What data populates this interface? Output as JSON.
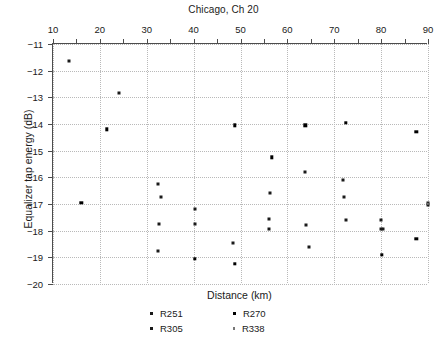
{
  "chart_data": {
    "type": "scatter",
    "title": "Chicago, Ch 20",
    "xlabel": "Distance (km)",
    "ylabel": "Equalizer tap energy (dB)",
    "xlim": [
      10,
      90
    ],
    "ylim": [
      -20,
      -11
    ],
    "y_inverted_axis": false,
    "x_axis_position": "top",
    "grid": true,
    "grid_style": "dotted",
    "xticks_major": [
      10,
      20,
      30,
      40,
      50,
      60,
      70,
      80,
      90
    ],
    "xticks_minor": [
      15,
      25,
      35,
      45,
      55,
      65,
      75,
      85
    ],
    "xticklabels": [
      "10",
      "20",
      "30",
      "40",
      "50",
      "60",
      "70",
      "80",
      "90"
    ],
    "yticks": [
      -11,
      -12,
      -13,
      -14,
      -15,
      -16,
      -17,
      -18,
      -19,
      -20
    ],
    "yticklabels": [
      "−11",
      "−12",
      "−13",
      "−14",
      "−15",
      "−16",
      "−17",
      "−18",
      "−19",
      "−20"
    ],
    "legend_position": "below-axes",
    "series": [
      {
        "name": "R251",
        "color": "#1a1a1a",
        "points": [
          {
            "x": 13.5,
            "y": -11.65
          },
          {
            "x": 24.0,
            "y": -12.85
          },
          {
            "x": 32.3,
            "y": -16.25
          },
          {
            "x": 33.0,
            "y": -16.75
          },
          {
            "x": 40.3,
            "y": -17.2
          },
          {
            "x": 32.4,
            "y": -18.75
          },
          {
            "x": 48.5,
            "y": -18.45
          },
          {
            "x": 56.2,
            "y": -16.6
          },
          {
            "x": 56.0,
            "y": -17.55
          },
          {
            "x": 56.0,
            "y": -17.95
          },
          {
            "x": 63.8,
            "y": -15.8
          },
          {
            "x": 64.0,
            "y": -17.8
          },
          {
            "x": 64.7,
            "y": -18.6
          },
          {
            "x": 71.8,
            "y": -16.1
          },
          {
            "x": 72.0,
            "y": -16.75
          },
          {
            "x": 72.5,
            "y": -17.6
          },
          {
            "x": 80.0,
            "y": -17.6
          },
          {
            "x": 80.0,
            "y": -17.95
          },
          {
            "x": 80.3,
            "y": -17.95
          },
          {
            "x": 90.0,
            "y": -16.95
          },
          {
            "x": 90.0,
            "y": -17.05
          }
        ]
      },
      {
        "name": "R270",
        "color": "#000000",
        "points": [
          {
            "x": 16.0,
            "y": -16.95
          },
          {
            "x": 21.5,
            "y": -14.2
          },
          {
            "x": 48.8,
            "y": -14.05
          },
          {
            "x": 63.8,
            "y": -14.05
          },
          {
            "x": 72.5,
            "y": -13.95
          },
          {
            "x": 87.5,
            "y": -14.3
          },
          {
            "x": 56.7,
            "y": -15.25
          },
          {
            "x": 40.2,
            "y": -19.05
          },
          {
            "x": 48.8,
            "y": -19.25
          },
          {
            "x": 80.2,
            "y": -18.9
          },
          {
            "x": 87.5,
            "y": -18.3
          }
        ]
      },
      {
        "name": "R305",
        "color": "#1a1a1a",
        "points": [
          {
            "x": 32.6,
            "y": -17.75
          },
          {
            "x": 40.2,
            "y": -17.75
          }
        ]
      },
      {
        "name": "R338",
        "color": "#777777",
        "points": [
          {
            "x": 90.0,
            "y": -17.0
          }
        ]
      }
    ]
  },
  "legend": {
    "entries": [
      {
        "label": "R251",
        "key": "R251"
      },
      {
        "label": "R270",
        "key": "R270"
      },
      {
        "label": "R305",
        "key": "R305"
      },
      {
        "label": "R338",
        "key": "R338"
      }
    ]
  },
  "colors": {
    "axis": "#4d4d4d",
    "grid": "#b9b9b9",
    "text": "#1a1a1a",
    "background": "#ffffff"
  }
}
